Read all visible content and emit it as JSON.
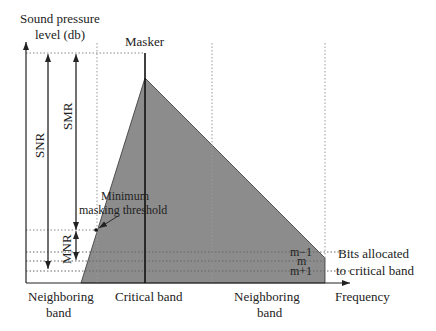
{
  "figure": {
    "y_axis_label_line1": "Sound pressure",
    "y_axis_label_line2": "level (db)",
    "x_axis_label": "Frequency",
    "masker_label": "Masker",
    "snr_label": "SNR",
    "smr_label": "SMR",
    "mnr_label": "MNR",
    "min_threshold_line1": "Minimum",
    "min_threshold_line2": "masking threshold",
    "bits_label_line1": "Bits allocated",
    "bits_label_line2": "to critical band",
    "level_m_minus_1": "m−1",
    "level_m": "m",
    "level_m_plus_1": "m+1",
    "band_left_line1": "Neighboring",
    "band_left_line2": "band",
    "band_center": "Critical band",
    "band_right_line1": "Neighboring",
    "band_right_line2": "band"
  },
  "colors": {
    "masking_fill": "#8c8c8c",
    "line": "#222222",
    "dotted": "#999999"
  }
}
